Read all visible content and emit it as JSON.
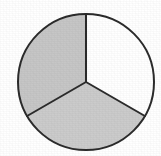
{
  "figure": {
    "title": "Circle divided into three equal parts, two shaded",
    "background_color": "#ffffff",
    "outline_color": "#2b2b2b",
    "outline_width_px": 2
  },
  "chart_data": {
    "type": "pie",
    "title": "",
    "subtitle": "",
    "xlabel": "",
    "ylabel": "",
    "legend_position": "none",
    "grid": false,
    "center_x": 86,
    "center_y": 82,
    "radius": 68,
    "start_angle_deg": -90,
    "total_slices": 3,
    "shaded_slices": 2,
    "fraction_shaded": "2/3",
    "categories": [
      "Upper left sector",
      "Right sector",
      "Bottom sector"
    ],
    "values": [
      1,
      1,
      1
    ],
    "percentages": [
      33.3,
      33.3,
      33.3
    ],
    "slices": [
      {
        "name": "Upper left sector",
        "value": 1,
        "percent": 33.3,
        "angle_deg": 120,
        "start_deg": -90,
        "end_deg": -210,
        "shaded": true,
        "fill": "#c6c6c6"
      },
      {
        "name": "Right sector",
        "value": 1,
        "percent": 33.3,
        "angle_deg": 120,
        "start_deg": -90,
        "end_deg": 30,
        "shaded": false,
        "fill": "#ffffff"
      },
      {
        "name": "Bottom sector",
        "value": 1,
        "percent": 33.3,
        "angle_deg": 120,
        "start_deg": 30,
        "end_deg": 150,
        "shaded": true,
        "fill": "#cbcbcb"
      }
    ],
    "annotations": []
  }
}
